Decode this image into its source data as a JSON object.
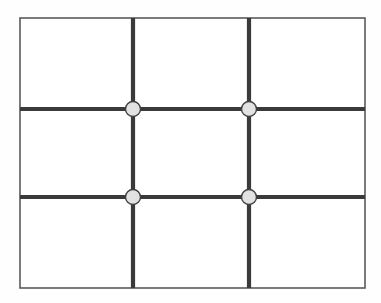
{
  "figure": {
    "type": "line-diagram",
    "background_color": "#fefefe",
    "canvas": {
      "width": 381,
      "height": 303
    }
  },
  "frame": {
    "name": "outer-rectangle-border",
    "x": 20,
    "y": 18,
    "width": 345,
    "height": 270,
    "stroke_color": "#5a5a5a",
    "stroke_width": 1.6,
    "fill": "none"
  },
  "grid": {
    "columns": 3,
    "rows": 3,
    "cells": 9,
    "stroke_color": "#3a3a3a",
    "stroke_width": 4.2,
    "vertical_lines": [
      {
        "name": "vertical-grid-line-1",
        "x": 133,
        "y1": 18,
        "y2": 288
      },
      {
        "name": "vertical-grid-line-2",
        "x": 249,
        "y1": 18,
        "y2": 288
      }
    ],
    "horizontal_lines": [
      {
        "name": "horizontal-grid-line-1",
        "y": 109,
        "x1": 20,
        "x2": 365
      },
      {
        "name": "horizontal-grid-line-2",
        "y": 197,
        "x1": 20,
        "x2": 365
      }
    ],
    "column_edges": [
      20,
      133,
      249,
      365
    ],
    "row_edges": [
      18,
      109,
      197,
      288
    ]
  },
  "nodes": {
    "count": 4,
    "radius": 7.5,
    "fill_color": "#e2e2e2",
    "stroke_color": "#404040",
    "stroke_width": 1.4,
    "items": [
      {
        "name": "node-top-left",
        "cx": 133,
        "cy": 109,
        "row": 1,
        "column": 1
      },
      {
        "name": "node-top-right",
        "cx": 249,
        "cy": 109,
        "row": 1,
        "column": 2
      },
      {
        "name": "node-bottom-left",
        "cx": 133,
        "cy": 197,
        "row": 2,
        "column": 1
      },
      {
        "name": "node-bottom-right",
        "cx": 249,
        "cy": 197,
        "row": 2,
        "column": 2
      }
    ]
  },
  "cells": [
    {
      "name": "cell-r1c1",
      "x": 20,
      "y": 18,
      "width": 113,
      "height": 91
    },
    {
      "name": "cell-r1c2",
      "x": 133,
      "y": 18,
      "width": 116,
      "height": 91
    },
    {
      "name": "cell-r1c3",
      "x": 249,
      "y": 18,
      "width": 116,
      "height": 91
    },
    {
      "name": "cell-r2c1",
      "x": 20,
      "y": 109,
      "width": 113,
      "height": 88
    },
    {
      "name": "cell-r2c2",
      "x": 133,
      "y": 109,
      "width": 116,
      "height": 88
    },
    {
      "name": "cell-r2c3",
      "x": 249,
      "y": 109,
      "width": 116,
      "height": 88
    },
    {
      "name": "cell-r3c1",
      "x": 20,
      "y": 197,
      "width": 113,
      "height": 91
    },
    {
      "name": "cell-r3c2",
      "x": 133,
      "y": 197,
      "width": 116,
      "height": 91
    },
    {
      "name": "cell-r3c3",
      "x": 249,
      "y": 197,
      "width": 116,
      "height": 91
    }
  ],
  "labels": {
    "has_text": false,
    "text_items": []
  }
}
